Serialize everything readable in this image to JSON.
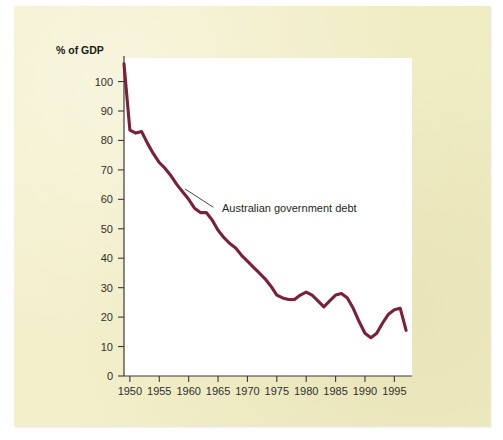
{
  "figure": {
    "background_color": "#ffffff",
    "panel_color": "#f2eec6",
    "plot_background": "#ffffff",
    "axis_color": "#3a3a3a"
  },
  "chart_data": {
    "type": "line",
    "title": "",
    "subtitle": "",
    "xlabel": "",
    "ylabel": "% of GDP",
    "ylabel_position": "top-left",
    "xlim": [
      1949,
      1998
    ],
    "ylim": [
      0,
      108
    ],
    "grid": false,
    "legend": "none",
    "yticks": [
      0,
      10,
      20,
      30,
      40,
      50,
      60,
      70,
      80,
      90,
      100
    ],
    "ytick_labels": [
      "0",
      "10",
      "20",
      "30",
      "40",
      "50",
      "60",
      "70",
      "80",
      "90",
      "100"
    ],
    "xticks": [
      1950,
      1955,
      1960,
      1965,
      1970,
      1975,
      1980,
      1985,
      1990,
      1995
    ],
    "xtick_labels": [
      "1950",
      "1955",
      "1960",
      "1965",
      "1970",
      "1975",
      "1980",
      "1985",
      "1990",
      "1995"
    ],
    "x_minor_step": 1,
    "series": [
      {
        "name": "Australian government debt",
        "color": "#7B1F3A",
        "line_width": 3.1,
        "x": [
          1949,
          1950,
          1951,
          1952,
          1953,
          1954,
          1955,
          1956,
          1957,
          1958,
          1959,
          1960,
          1961,
          1962,
          1963,
          1964,
          1965,
          1966,
          1967,
          1968,
          1969,
          1970,
          1971,
          1972,
          1973,
          1974,
          1975,
          1976,
          1977,
          1978,
          1979,
          1980,
          1981,
          1982,
          1983,
          1984,
          1985,
          1986,
          1987,
          1988,
          1989,
          1990,
          1991,
          1992,
          1993,
          1994,
          1995,
          1996,
          1997
        ],
        "values": [
          106.0,
          83.5,
          82.5,
          83.0,
          79.0,
          75.5,
          72.5,
          70.5,
          68.0,
          65.0,
          62.5,
          60.0,
          57.0,
          55.5,
          55.5,
          53.0,
          49.5,
          47.0,
          45.0,
          43.5,
          41.0,
          39.0,
          37.0,
          35.0,
          33.0,
          30.5,
          27.5,
          26.5,
          26.0,
          26.0,
          27.5,
          28.5,
          27.5,
          25.5,
          23.5,
          25.5,
          27.5,
          28.0,
          26.5,
          23.0,
          18.5,
          14.5,
          13.0,
          14.5,
          18.0,
          21.0,
          22.5,
          23.0,
          15.5
        ]
      }
    ],
    "annotations": [
      {
        "text": "Australian government debt",
        "label_x": 1965.0,
        "label_y": 57.0,
        "leader_from_x": 1959.4,
        "leader_from_y": 63.5,
        "leader_to_x": 1964.2,
        "leader_to_y": 57.3
      }
    ]
  }
}
